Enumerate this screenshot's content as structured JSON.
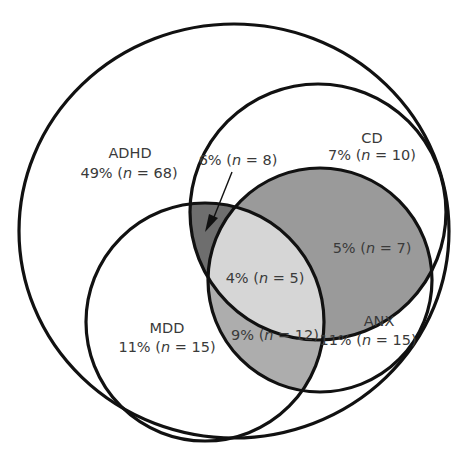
{
  "diagram": {
    "type": "venn",
    "sets": [
      {
        "id": "ADHD",
        "label": "ADHD",
        "value": "49% (n = 68)",
        "percent": 49,
        "n": 68
      },
      {
        "id": "CD",
        "label": "CD",
        "value": "7% (n = 10)",
        "percent": 7,
        "n": 10
      },
      {
        "id": "MDD",
        "label": "MDD",
        "value": "11% (n = 15)",
        "percent": 11,
        "n": 15
      },
      {
        "id": "ANX",
        "label": "ANX",
        "value": "11% (n = 15)",
        "percent": 11,
        "n": 15
      }
    ],
    "intersections": [
      {
        "sets": [
          "ADHD",
          "CD",
          "MDD"
        ],
        "value": "6% (n = 8)",
        "percent": 6,
        "n": 8,
        "note": "indicated by arrow"
      },
      {
        "sets": [
          "ADHD",
          "CD",
          "ANX"
        ],
        "value": "5% (n = 7)",
        "percent": 5,
        "n": 7
      },
      {
        "sets": [
          "ADHD",
          "CD",
          "MDD",
          "ANX"
        ],
        "value": "4% (n = 5)",
        "percent": 4,
        "n": 5
      },
      {
        "sets": [
          "ADHD",
          "MDD",
          "ANX"
        ],
        "value": "9% (n = 12)",
        "percent": 9,
        "n": 12
      }
    ],
    "colors": {
      "outline": "#111111",
      "text": "#3a3a3a",
      "adhd_cd_mdd": "#6e6e6e",
      "adhd_cd_anx": "#9a9a9a",
      "all_four": "#d6d6d6",
      "adhd_mdd_anx": "#adadad",
      "background": "#ffffff"
    }
  },
  "labels": {
    "adhd": {
      "name": "ADHD",
      "pct": "49% (",
      "n": "n",
      "eq": " = 68)"
    },
    "cd": {
      "name": "CD",
      "pct": "7% (",
      "n": "n",
      "eq": " = 10)"
    },
    "mdd": {
      "name": "MDD",
      "pct": "11% (",
      "n": "n",
      "eq": " = 15)"
    },
    "anx": {
      "name": "ANX",
      "pct": "11% (",
      "n": "n",
      "eq": " = 15)"
    },
    "adhd_cd_mdd": {
      "pct": "6% (",
      "n": "n",
      "eq": " = 8)"
    },
    "adhd_cd_anx": {
      "pct": "5% (",
      "n": "n",
      "eq": " = 7)"
    },
    "all_four": {
      "pct": "4% (",
      "n": "n",
      "eq": " = 5)"
    },
    "adhd_mdd_anx": {
      "pct": "9% (",
      "n": "n",
      "eq": " = 12)"
    }
  }
}
